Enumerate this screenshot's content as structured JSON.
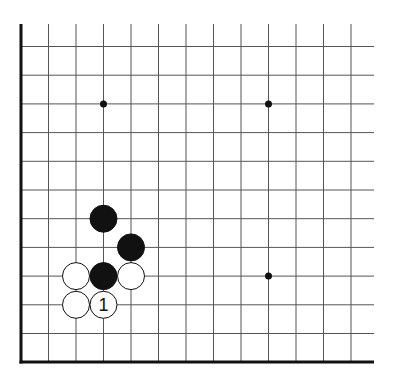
{
  "diagram": {
    "type": "go-board-fragment",
    "columns_x": [
      21,
      48.5,
      76,
      103.5,
      131,
      158.5,
      186,
      213.5,
      241,
      268.5,
      296,
      323.5,
      351
    ],
    "rows_y": [
      46.5,
      75.2,
      103.9,
      132.6,
      161.3,
      190,
      218.7,
      247.4,
      276.1,
      304.8,
      333.5,
      362
    ],
    "grid_left": 21,
    "grid_right": 374,
    "grid_top": 24,
    "grid_bottom": 362,
    "line_color": "#555555",
    "edge_color": "#111111",
    "star_points": [
      {
        "col": 3,
        "row": 2
      },
      {
        "col": 9,
        "row": 2
      },
      {
        "col": 9,
        "row": 8
      }
    ],
    "stones": [
      {
        "color": "black",
        "col": 3,
        "row": 6,
        "label": ""
      },
      {
        "color": "black",
        "col": 4,
        "row": 7,
        "label": ""
      },
      {
        "color": "black",
        "col": 3,
        "row": 8,
        "label": ""
      },
      {
        "color": "white",
        "col": 2,
        "row": 8,
        "label": ""
      },
      {
        "color": "white",
        "col": 4,
        "row": 8,
        "label": ""
      },
      {
        "color": "white",
        "col": 2,
        "row": 9,
        "label": ""
      },
      {
        "color": "white",
        "col": 3,
        "row": 9,
        "label": "1"
      }
    ],
    "stone_radius": 13.5
  }
}
